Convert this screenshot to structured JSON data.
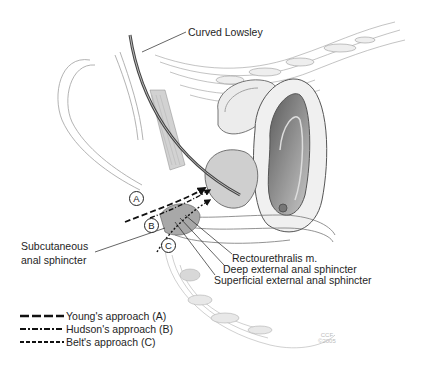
{
  "figure": {
    "type": "anatomical-illustration",
    "colors": {
      "background": "#ffffff",
      "ink": "#222222",
      "tissue_light": "#e6e6e6",
      "tissue_mid": "#b8b8b8",
      "tissue_dark": "#6a6a6a"
    }
  },
  "labels": {
    "curved_lowsley": "Curved Lowsley",
    "subcutaneous_line1": "Subcutaneous",
    "subcutaneous_line2": "anal sphincter",
    "rectourethralis": "Rectourethralis m.",
    "deep_external": "Deep external anal sphincter",
    "superficial_external": "Superficial external anal sphincter"
  },
  "markers": {
    "a": "A",
    "b": "B",
    "c": "C"
  },
  "legend": [
    {
      "style": "long-dash",
      "label": "Young's approach (A)"
    },
    {
      "style": "dash-dot",
      "label": "Hudson's approach (B)"
    },
    {
      "style": "short-dash",
      "label": "Belt's approach (C)"
    }
  ],
  "watermark": {
    "line1": "CCF",
    "line2": "©2005"
  }
}
